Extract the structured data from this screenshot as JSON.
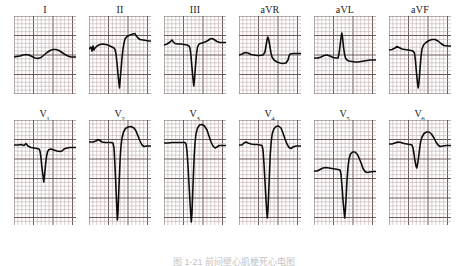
{
  "figure": {
    "caption": "图 1-21  前间壁心肌梗死心电图",
    "background_color": "#ffffff",
    "trace_color": "#0d0d0d",
    "grid_minor_color": "#b9a6a6",
    "grid_major_color": "#6e5c5c",
    "grid_minor_mm": 3.9,
    "grid_major_every": 5
  },
  "rows": [
    {
      "name": "limb-leads",
      "panel_width": 62,
      "panel_height": 78,
      "leads": [
        {
          "label": "I",
          "base": "I",
          "subscript": "",
          "baseline_y": 40,
          "description": "low-amplitude undulating baseline, no discrete QRS",
          "path": "M0,41 L3,40.5 L6,40 L9,39 L12,38.5 L15,39 L18,40.5 L21,42 L24,42.5 L27,41.5 L30,39 L33,36.5 L36,34.5 L39,33.5 L42,33.5 L45,34.5 L48,36.5 L51,38.5 L54,40 L57,41 L60,41 L62,41"
        },
        {
          "label": "II",
          "base": "II",
          "subscript": "",
          "baseline_y": 34,
          "description": "small notched P, deep narrow S wave to 72, tall recovery with T peak",
          "path": "M0,33 L2,31 L3,35 L4,30 L5,34 L6,32 L8,30 L11,28.5 L14,28 L17,28.5 L20,29.5 L23,31 L25,32 L26,33.5 L27,38 L28,47 L29,58 L30,68 L30.5,72 L31,66 L32,54 L33,42 L34,33 L35,27 L36,23 L38,20.5 L41,19 L44,18 L46,17.5 L47,19.5 L49,22 L51,23.5 L54,24 L57,24.5 L60,25 L62,25"
        },
        {
          "label": "III",
          "base": "III",
          "subscript": "",
          "baseline_y": 27,
          "description": "notched P hump, deep S to 70, then rounded T wave",
          "path": "M0,29 L3,28 L6,26 L8,24 L9,25.5 L11,27.5 L14,28 L17,28 L20,28.5 L23,29 L25,30 L26,32 L27,40 L28,52 L29,63 L29.8,70 L30.5,63 L31.5,50 L32.5,38 L33.5,31 L35,28 L38,27 L41,26 L44,24.5 L46,23 L48,22.5 L50,23.5 L53,25.5 L56,26.5 L59,26.5 L62,26.5"
        },
        {
          "label": "aVR",
          "base": "aVR",
          "subscript": "",
          "baseline_y": 38,
          "description": "flat baseline with small upright R spike then shallow negative T trough",
          "path": "M0,39 L3,38 L6,36.5 L9,37 L12,38.5 L15,39 L18,39.5 L21,39.5 L24,39 L26,36 L27,30 L28,24 L28.8,21 L29.8,24 L31,31 L32,37 L33,41 L35,44 L38,46 L41,47 L44,47.5 L47,47 L49,44 L50,40 L51,38 L54,37.5 L57,37.5 L60,37.5 L62,37.5"
        },
        {
          "label": "aVL",
          "base": "aVL",
          "subscript": "",
          "baseline_y": 41,
          "description": "tall narrow R spike to 17, small P bump before, flat after",
          "path": "M0,42 L4,42 L7,41 L10,39.5 L13,39 L16,40 L19,41.5 L22,42 L24,42 L25,38 L26,30 L27,22 L27.8,17 L28.6,22 L29.5,31 L30.5,38 L31.5,42 L33,44 L35,45 L38,45.5 L41,46 L44,46 L47,45.5 L50,45 L53,44.5 L56,44 L59,44 L62,44"
        },
        {
          "label": "aVF",
          "base": "aVF",
          "subscript": "",
          "baseline_y": 33,
          "description": "deep narrow S to 72 then broad positive T wave",
          "path": "M0,34 L3,33.5 L6,32 L8,30.5 L10,31.5 L13,33 L16,33.5 L19,34 L22,34.5 L24,35 L25.5,37 L26.5,45 L27.5,57 L28.5,67 L29.2,72 L30,66 L31,53 L32,41 L33,33 L34.5,29 L37,26.5 L40,24.5 L43,23.5 L46,23.5 L49,25 L52,27.5 L55,29.5 L58,30 L62,30"
        }
      ]
    },
    {
      "name": "precordial-leads",
      "panel_width": 62,
      "panel_height": 105,
      "leads": [
        {
          "label": "V1",
          "base": "V",
          "subscript": "1",
          "baseline_y": 26,
          "description": "small rS, deep narrow S to 62, returns to baseline with slight rise",
          "path": "M0,25 L4,25 L7,24.5 L10,25.5 L12,23.5 L14,26 L17,27.5 L20,28 L23,28.5 L25,29 L26,31 L27,38 L28,48 L29,56 L29.8,62 L30.6,55 L31.6,44 L32.6,36 L33.6,31.5 L35,29.5 L37,29 L40,30 L43,31 L46,31.5 L48,31 L50,29 L53,28 L56,27.5 L59,27.5 L62,27.5"
        },
        {
          "label": "V2",
          "base": "V",
          "subscript": "2",
          "baseline_y": 22,
          "description": "QS pattern: very deep narrow Q descending to 100, tall broad coved T wave",
          "path": "M0,22 L4,22 L7,21 L9,19.5 L11,20.5 L13,22 L16,22.5 L19,22.5 L22,22.5 L24,23 L25,28 L25.8,42 L26.6,60 L27.4,78 L28,92 L28.4,100 L29,92 L29.6,76 L30.4,56 L31.2,38 L32,26 L33,18 L34.5,12 L36.5,8.5 L39,7 L42,6.5 L45,8 L47,11 L49,16 L51,21 L53,25 L55,26.5 L58,26 L62,26"
        },
        {
          "label": "V3",
          "base": "V",
          "subscript": "3",
          "baseline_y": 22,
          "description": "QS deep to 102, very tall rounded T wave peaking near 5, slight terminal notch",
          "path": "M0,23 L4,23 L8,22.5 L12,22.5 L16,22.5 L19,22.5 L21,22.5 L22,24 L23,31 L24,46 L25,64 L26,82 L26.8,95 L27.3,102 L28,93 L28.6,76 L29.4,55 L30.2,36 L31,23 L32,14 L33.5,8 L35.5,5 L38,4.5 L40.5,6 L43,10 L45,16 L47,22 L49,26 L51,28 L53,27 L55,25.5 L58,25.5 L62,25.5"
        },
        {
          "label": "V4",
          "base": "V",
          "subscript": "4",
          "baseline_y": 24,
          "description": "QS deep to 98, tall rounded T wave, small P bump at start",
          "path": "M0,25 L3,25 L5,23 L7,22 L9,23 L12,24 L15,24.5 L18,24.5 L21,25 L23,25.5 L24,30 L25,44 L26,62 L27,80 L27.8,92 L28.3,98 L29,89 L29.7,72 L30.5,52 L31.3,34 L32.2,22 L33.2,14 L34.8,9 L37,6.5 L39.5,6 L42,8 L44,13 L46,19 L48,24 L50,27.5 L52,28.5 L54,27 L57,26 L60,26 L62,26"
        },
        {
          "label": "V5",
          "base": "V",
          "subscript": "5",
          "baseline_y": 50,
          "description": "elevated baseline, deep narrow S to 98, tall T wave peaking near 32",
          "path": "M0,51 L3,51 L6,49.5 L9,48 L12,47.5 L15,48 L18,48.5 L21,49 L24,49.5 L26,50 L27,54 L28,66 L29,80 L30,91 L30.7,98 L31.4,90 L32.2,76 L33,60 L34,47 L35,39 L36.5,34 L38.5,32 L41,32 L43.5,34.5 L45.5,39 L47.5,44 L49,48.5 L51,51.5 L53,52.5 L56,52 L59,51.5 L62,51.5"
        },
        {
          "label": "V6",
          "base": "V",
          "subscript": "6",
          "baseline_y": 24,
          "description": "shallow narrow S to 48, rounded positive T wave, smallest precordial amplitude",
          "path": "M0,24 L3,24 L6,23 L9,22 L12,22.5 L15,23.5 L18,24 L21,24.5 L23,25 L24,28 L25,34 L26,41 L27,46 L27.8,48 L28.6,44 L29.6,37 L30.6,29 L31.6,22 L33,17 L35,13.5 L37.5,12 L40,12 L42.5,14 L45,18 L47,22 L49,25 L51,26.5 L54,26 L57,25.5 L62,25.5"
        }
      ]
    }
  ]
}
